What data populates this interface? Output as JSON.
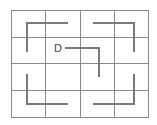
{
  "diagram": {
    "type": "grid-maze",
    "rows": 4,
    "columns": 4,
    "label": "D",
    "colors": {
      "grid": "#8a8a8a",
      "path": "#7a7a7a",
      "text": "#444444",
      "background": "#ffffff"
    },
    "paths": [
      {
        "name": "top-left-corner-path",
        "shape": "corner",
        "opens": "down-right"
      },
      {
        "name": "top-right-corner-path",
        "shape": "corner",
        "opens": "down-left"
      },
      {
        "name": "center-d-path",
        "shape": "corner",
        "opens": "down-left",
        "starts_at_label": "D"
      },
      {
        "name": "bottom-left-corner-path",
        "shape": "corner",
        "opens": "up-right"
      },
      {
        "name": "bottom-right-corner-path",
        "shape": "corner",
        "opens": "up-left"
      }
    ]
  }
}
